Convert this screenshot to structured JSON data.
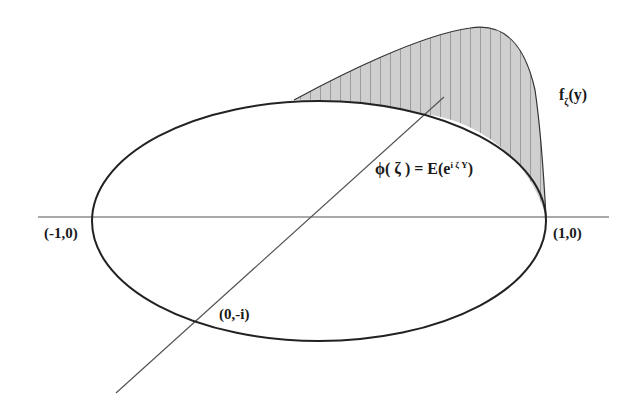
{
  "diagram": {
    "type": "characteristic-function-illustration",
    "labels": {
      "minus_one": "(-1,0)",
      "plus_one": "(1,0)",
      "minus_i": "(0,-i)",
      "density_f": "f",
      "density_sub": "ζ",
      "density_arg": "(y)",
      "phi_lhs": "ϕ( ζ ) = E(e",
      "phi_sup": "i ζ Y",
      "phi_rhs": ")"
    },
    "colors": {
      "stroke": "#222222",
      "axis": "#555555",
      "fill": "#c8c8c8",
      "hatch": "#666666"
    }
  }
}
